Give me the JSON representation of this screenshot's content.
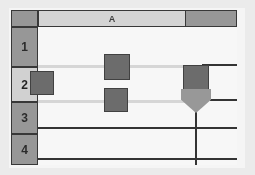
{
  "app": {
    "type": "spreadsheet-grid",
    "title": "Spreadsheet grid fragment"
  },
  "colors": {
    "header_unselected": "#999999",
    "header_selected": "#d9d9d9",
    "grid_background": "#ffffff",
    "grid_line_dark": "#2f2f2f",
    "grid_line_light": "#dcdcdc",
    "node_fill": "#6b6b6b",
    "node_border": "#3d3d3d",
    "arrow_fill": "#9a9a9a",
    "frame_border": "#2b2b2b"
  },
  "column_headers": [
    {
      "label": "A",
      "selected": true
    },
    {
      "label": "",
      "selected": false
    }
  ],
  "row_headers": [
    {
      "label": "1",
      "selected": false
    },
    {
      "label": "2",
      "selected": true
    },
    {
      "label": "3",
      "selected": false
    },
    {
      "label": "4",
      "selected": false
    }
  ],
  "corner": {
    "label": "",
    "name": "select-all-corner"
  },
  "markers": {
    "squares": [
      {
        "id": "square-row2-left",
        "label": ""
      },
      {
        "id": "square-row1-middle",
        "label": ""
      },
      {
        "id": "square-row2-middle",
        "label": ""
      },
      {
        "id": "square-row2-right",
        "label": ""
      }
    ],
    "arrow": {
      "id": "down-arrow-marker",
      "direction": "down",
      "label": ""
    }
  },
  "lines": {
    "light_guides": 2,
    "dark_rules": 4,
    "vertical_dividers": 1
  }
}
